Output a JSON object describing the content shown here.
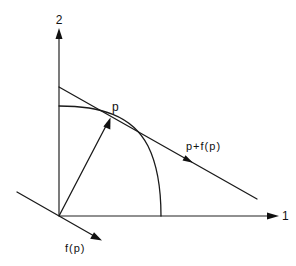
{
  "figure": {
    "type": "vector-field-tangent-diagram",
    "axes": {
      "x_label": "1",
      "y_label": "2"
    },
    "labels": {
      "point": "p",
      "tangent_line": "p+f(p)",
      "vector": "f(p)"
    },
    "elements": [
      {
        "name": "horizontal-axis",
        "label": "1",
        "kind": "axis-arrow"
      },
      {
        "name": "vertical-axis",
        "label": "2",
        "kind": "axis-arrow"
      },
      {
        "name": "boundary-curve",
        "kind": "quarter-arc",
        "description": "concave curve from the vertical axis to the horizontal axis"
      },
      {
        "name": "position-vector",
        "kind": "arrow",
        "from": "origin",
        "to": "p"
      },
      {
        "name": "tangent-line",
        "kind": "line-with-direction-arrow",
        "label": "p+f(p)",
        "touches": "p"
      },
      {
        "name": "vector-f-of-p",
        "kind": "line-with-direction-arrow",
        "label": "f(p)",
        "through": "origin",
        "parallel_to": "tangent-line"
      }
    ],
    "colors": {
      "ink": "#111111",
      "background": "#ffffff"
    }
  }
}
